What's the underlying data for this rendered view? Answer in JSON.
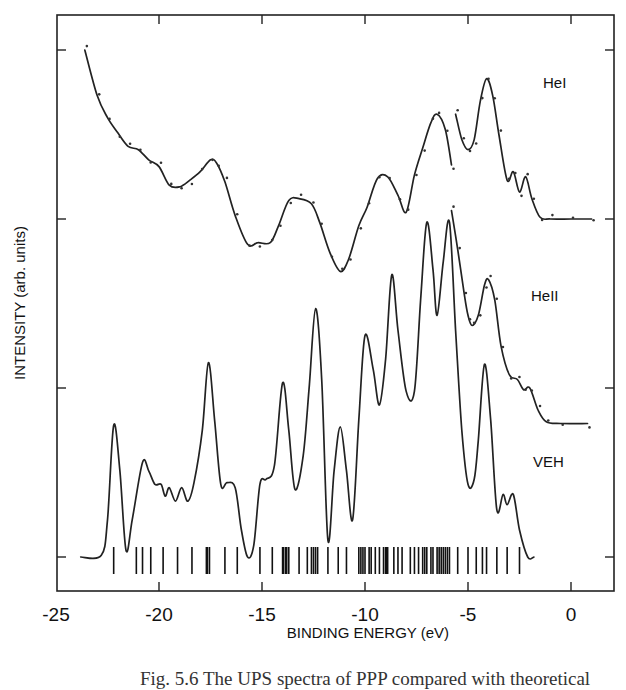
{
  "chart_data": {
    "type": "line",
    "title": "",
    "xlabel": "BINDING ENERGY (eV)",
    "ylabel": "INTENSITY (arb. units)",
    "xlim": [
      -25,
      2
    ],
    "x_ticks": [
      -25,
      -20,
      -15,
      -10,
      -5,
      0
    ],
    "x_tick_labels": [
      "-25",
      "-20",
      "-15",
      "-10",
      "-5",
      "0"
    ],
    "y_ticks_unlabeled": true,
    "grid": false,
    "legend": "inline labels at right",
    "series": [
      {
        "name": "HeI",
        "label": "HeI",
        "style": "line with experimental dots",
        "segments": [
          {
            "x": [
              -23.6,
              -23.0,
              -22.5,
              -22.0,
              -21.5,
              -21.0,
              -20.5,
              -20.0,
              -19.5,
              -19.0,
              -18.5,
              -18.0,
              -17.5,
              -17.2,
              -16.8,
              -16.3,
              -15.7,
              -15.2,
              -14.6,
              -14.2,
              -13.7,
              -13.2,
              -12.6,
              -12.2,
              -11.7,
              -11.2,
              -10.8,
              -10.3,
              -9.9,
              -9.4,
              -8.9,
              -8.4,
              -8.0,
              -7.6,
              -7.2,
              -6.8,
              -6.5,
              -6.1,
              -5.8
            ],
            "y": [
              3.0,
              2.73,
              2.6,
              2.51,
              2.43,
              2.41,
              2.35,
              2.31,
              2.2,
              2.19,
              2.23,
              2.28,
              2.35,
              2.33,
              2.22,
              2.02,
              1.85,
              1.86,
              1.86,
              1.96,
              2.11,
              2.12,
              2.09,
              1.98,
              1.8,
              1.69,
              1.76,
              1.96,
              2.07,
              2.24,
              2.25,
              2.14,
              2.04,
              2.26,
              2.42,
              2.57,
              2.62,
              2.53,
              2.32
            ]
          },
          {
            "x": [
              -5.6,
              -5.3,
              -5.0,
              -4.7,
              -4.4,
              -4.1,
              -3.8,
              -3.5,
              -3.1,
              -2.8,
              -2.5,
              -2.2,
              -1.9,
              -1.5,
              -1.0,
              0.0,
              1.0
            ],
            "y": [
              2.62,
              2.47,
              2.41,
              2.47,
              2.7,
              2.83,
              2.73,
              2.5,
              2.23,
              2.28,
              2.16,
              2.25,
              2.12,
              2.01,
              2.0,
              2.0,
              2.0
            ]
          }
        ]
      },
      {
        "name": "HeII",
        "label": "HeII",
        "style": "line with experimental dots",
        "segments": [
          {
            "x": [
              -5.8,
              -5.5,
              -5.2,
              -5.0,
              -4.8,
              -4.5,
              -4.2,
              -4.0,
              -3.7,
              -3.4,
              -3.0,
              -2.6,
              -2.3,
              -2.0,
              -1.6,
              -1.2,
              -0.5,
              0.8
            ],
            "y": [
              2.05,
              1.82,
              1.57,
              1.43,
              1.37,
              1.43,
              1.61,
              1.64,
              1.52,
              1.25,
              1.08,
              1.05,
              0.99,
              1.0,
              0.87,
              0.8,
              0.79,
              0.79
            ]
          }
        ]
      },
      {
        "name": "VEH",
        "label": "VEH",
        "style": "theoretical line",
        "segments": [
          {
            "x": [
              -23.8,
              -22.8,
              -22.5,
              -22.2,
              -21.9,
              -21.6,
              -21.3,
              -20.8,
              -20.5,
              -20.2,
              -19.9,
              -19.7,
              -19.5,
              -19.2,
              -18.9,
              -18.6,
              -18.3,
              -17.9,
              -17.6,
              -17.3,
              -17.0,
              -16.7,
              -16.3,
              -16.0,
              -15.7,
              -15.4,
              -15.1,
              -14.8,
              -14.4,
              -14.0,
              -13.7,
              -13.4,
              -13.0,
              -12.7,
              -12.4,
              -12.1,
              -11.8,
              -11.5,
              -11.2,
              -10.9,
              -10.6,
              -10.3,
              -10.0,
              -9.6,
              -9.3,
              -9.0,
              -8.7,
              -8.4,
              -8.0,
              -7.6,
              -7.3,
              -7.0,
              -6.7,
              -6.5,
              -6.2,
              -5.9,
              -5.6,
              -5.3,
              -5.0,
              -4.7,
              -4.5,
              -4.2,
              -3.9,
              -3.6,
              -3.3,
              -3.1,
              -2.8,
              -2.5,
              -2.1,
              -1.8
            ],
            "y": [
              0,
              0.01,
              0.22,
              0.78,
              0.51,
              0.04,
              0.22,
              0.56,
              0.51,
              0.43,
              0.43,
              0.36,
              0.41,
              0.33,
              0.41,
              0.33,
              0.44,
              0.75,
              1.15,
              0.81,
              0.43,
              0.44,
              0.41,
              0.16,
              0.0,
              0.07,
              0.43,
              0.46,
              0.54,
              1.03,
              0.75,
              0.4,
              0.6,
              1.02,
              1.47,
              1.05,
              0.1,
              0.51,
              0.77,
              0.51,
              0.22,
              0.81,
              1.31,
              1.11,
              0.9,
              1.17,
              1.67,
              1.34,
              0.98,
              0.98,
              1.52,
              1.98,
              1.7,
              1.43,
              1.75,
              1.98,
              1.34,
              0.75,
              0.43,
              0.46,
              0.69,
              1.14,
              0.81,
              0.28,
              0.37,
              0.31,
              0.37,
              0.16,
              0.0,
              0.0
            ]
          }
        ]
      }
    ],
    "state_markers": {
      "description": "vertical bars marking VEH one-electron energy levels",
      "x": [
        -22.2,
        -21.1,
        -20.8,
        -20.4,
        -19.8,
        -19.1,
        -18.4,
        -17.7,
        -17.65,
        -17.55,
        -16.8,
        -16.2,
        -15.1,
        -14.5,
        -14.0,
        -13.95,
        -13.85,
        -13.8,
        -13.7,
        -13.2,
        -12.8,
        -12.6,
        -12.5,
        -12.4,
        -12.3,
        -11.8,
        -11.3,
        -10.9,
        -10.3,
        -10.2,
        -10.1,
        -10.0,
        -9.8,
        -9.7,
        -9.5,
        -9.3,
        -9.1,
        -9.0,
        -8.95,
        -8.9,
        -8.6,
        -8.4,
        -8.2,
        -7.8,
        -7.6,
        -7.4,
        -7.2,
        -7.1,
        -7.0,
        -6.8,
        -6.7,
        -6.5,
        -6.4,
        -6.3,
        -6.2,
        -6.1,
        -6.0,
        -5.9,
        -5.5,
        -5.0,
        -4.6,
        -4.3,
        -4.1,
        -3.6,
        -3.1,
        -2.5
      ]
    }
  },
  "caption_partial": "Fig. 5.6   The UPS spectra of PPP compared with theoretical"
}
